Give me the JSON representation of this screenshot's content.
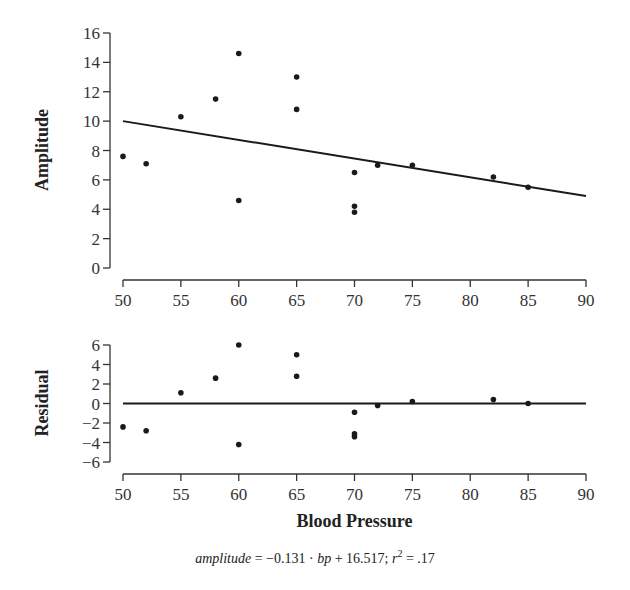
{
  "chart_data": [
    {
      "type": "scatter",
      "title": "",
      "xlabel": "",
      "ylabel": "Amplitude",
      "xlim": [
        50,
        90
      ],
      "ylim": [
        0,
        16
      ],
      "xticks": [
        50,
        55,
        60,
        65,
        70,
        75,
        80,
        85,
        90
      ],
      "yticks": [
        0,
        2,
        4,
        6,
        8,
        10,
        12,
        14,
        16
      ],
      "grid": false,
      "series": [
        {
          "name": "observations",
          "points": [
            {
              "x": 50,
              "y": 7.6
            },
            {
              "x": 52,
              "y": 7.1
            },
            {
              "x": 55,
              "y": 10.3
            },
            {
              "x": 58,
              "y": 11.5
            },
            {
              "x": 60,
              "y": 14.6
            },
            {
              "x": 60,
              "y": 4.6
            },
            {
              "x": 65,
              "y": 13.0
            },
            {
              "x": 65,
              "y": 10.8
            },
            {
              "x": 70,
              "y": 6.5
            },
            {
              "x": 70,
              "y": 4.2
            },
            {
              "x": 70,
              "y": 3.8
            },
            {
              "x": 72,
              "y": 7.0
            },
            {
              "x": 75,
              "y": 7.0
            },
            {
              "x": 82,
              "y": 6.2
            },
            {
              "x": 85,
              "y": 5.5
            }
          ]
        },
        {
          "name": "fit",
          "type": "line",
          "points": [
            {
              "x": 50,
              "y": 10.0
            },
            {
              "x": 90,
              "y": 4.9
            }
          ]
        }
      ]
    },
    {
      "type": "scatter",
      "title": "",
      "xlabel": "Blood Pressure",
      "ylabel": "Residual",
      "xlim": [
        50,
        90
      ],
      "ylim": [
        -6,
        6
      ],
      "xticks": [
        50,
        55,
        60,
        65,
        70,
        75,
        80,
        85,
        90
      ],
      "yticks": [
        -6,
        -4,
        -2,
        0,
        2,
        4,
        6
      ],
      "grid": false,
      "series": [
        {
          "name": "residuals",
          "points": [
            {
              "x": 50,
              "y": -2.4
            },
            {
              "x": 52,
              "y": -2.8
            },
            {
              "x": 55,
              "y": 1.1
            },
            {
              "x": 58,
              "y": 2.6
            },
            {
              "x": 60,
              "y": 6.0
            },
            {
              "x": 60,
              "y": -4.2
            },
            {
              "x": 65,
              "y": 5.0
            },
            {
              "x": 65,
              "y": 2.8
            },
            {
              "x": 70,
              "y": -0.9
            },
            {
              "x": 70,
              "y": -3.1
            },
            {
              "x": 70,
              "y": -3.4
            },
            {
              "x": 72,
              "y": -0.2
            },
            {
              "x": 75,
              "y": 0.2
            },
            {
              "x": 82,
              "y": 0.4
            },
            {
              "x": 85,
              "y": 0.0
            }
          ]
        },
        {
          "name": "zero-line",
          "type": "line",
          "points": [
            {
              "x": 50,
              "y": 0
            },
            {
              "x": 90,
              "y": 0
            }
          ]
        }
      ]
    }
  ],
  "caption": {
    "lhs": "amplitude",
    "eq_part1": " = −0.131 · ",
    "var": "bp",
    "eq_part2": " + 16.517; ",
    "r": "r",
    "sup": "2",
    "eq_part3": " = .17"
  },
  "colors": {
    "ink": "#1a1a1a",
    "axis": "#333333"
  }
}
